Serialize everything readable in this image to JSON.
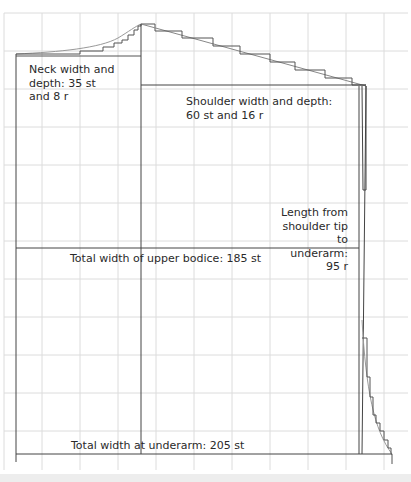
{
  "diagram": {
    "colors": {
      "grid": "#dcdcdc",
      "outline": "#444444",
      "curve": "#888888",
      "text": "#2a2a2a"
    },
    "grid": {
      "x0": 4,
      "y0": 13,
      "cell": 38,
      "cols": 11,
      "rows": 12
    },
    "labels": {
      "neck": "Neck width and\ndepth: 35 st\nand 8 r",
      "shoulder": "Shoulder width and depth:\n60 st and 16 r",
      "length": "Length from\nshoulder tip to\nunderarm: 95 r",
      "upper_bodice": "Total width of upper bodice: 185 st",
      "underarm": "Total width at underarm: 205 st"
    },
    "measurements": {
      "neck_width_st": 35,
      "neck_depth_r": 8,
      "shoulder_width_st": 60,
      "shoulder_depth_r": 16,
      "length_shoulder_to_underarm_r": 95,
      "upper_bodice_width_st": 185,
      "underarm_width_st": 205
    }
  }
}
